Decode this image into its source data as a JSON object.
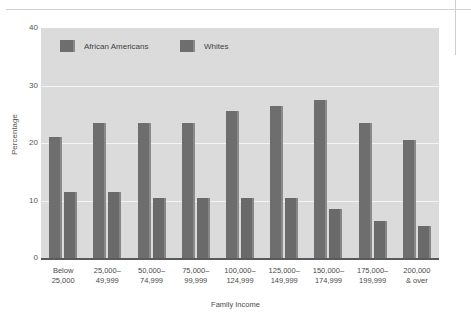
{
  "chart_data": {
    "type": "bar",
    "title": "",
    "xlabel": "Family Income",
    "ylabel": "Percentage",
    "ylim": [
      0,
      40
    ],
    "yticks": [
      0,
      10,
      20,
      30,
      40
    ],
    "grid": true,
    "legend_position": "top-inside",
    "categories": [
      "Below\n25,000",
      "25,000–\n49,999",
      "50,000–\n74,999",
      "75,000–\n99,999",
      "100,000–\n124,999",
      "125,000–\n149,999",
      "150,000–\n174,999",
      "175,000–\n199,999",
      "200,000\n& over"
    ],
    "series": [
      {
        "name": "African Americans",
        "color": "#6e6e6e",
        "values": [
          21,
          23.5,
          23.5,
          23.5,
          25.5,
          26.5,
          27.5,
          23.5,
          20.5
        ]
      },
      {
        "name": "Whites",
        "color": "#6a6a6a",
        "values": [
          11.5,
          11.5,
          10.5,
          10.5,
          10.5,
          10.5,
          8.5,
          6.5,
          5.5
        ]
      }
    ]
  },
  "axis": {
    "y_ticks": [
      "0",
      "10",
      "20",
      "30",
      "40"
    ],
    "y_title": "Percentage",
    "x_title": "Family Income",
    "x_tick_lines": [
      [
        "Below",
        "25,000"
      ],
      [
        "25,000–",
        "49,999"
      ],
      [
        "50,000–",
        "74,999"
      ],
      [
        "75,000–",
        "99,999"
      ],
      [
        "100,000–",
        "124,999"
      ],
      [
        "125,000–",
        "149,999"
      ],
      [
        "150,000–",
        "174,999"
      ],
      [
        "175,000–",
        "199,999"
      ],
      [
        "200,000",
        "& over"
      ]
    ]
  },
  "legend": {
    "items": [
      {
        "label": "African Americans"
      },
      {
        "label": "Whites"
      }
    ]
  },
  "colors": {
    "plot_background": "#dcdcdc",
    "gridline": "#f4f4f4",
    "bar_african_americans": "#6e6e6e",
    "bar_whites": "#6a6a6a",
    "axis_line": "#5a5a5a",
    "text": "#4a4a4a"
  }
}
